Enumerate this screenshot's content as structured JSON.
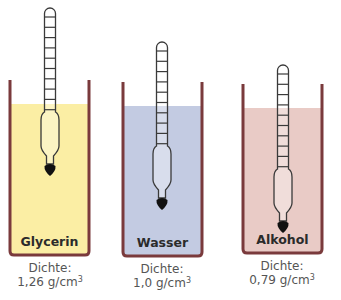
{
  "diagram": {
    "wall_color": "#7a3a3c",
    "hydrometer_stroke": "#3a3a3a",
    "weight_color": "#111111",
    "containers": [
      {
        "id": "glycerin",
        "label": "Glycerin",
        "density_label": "Dichte:",
        "density_value": "1,26 g/cm",
        "density_exp": "3",
        "liquid_color": "#fbeea4",
        "x": 10,
        "width": 79,
        "top": 80,
        "liquid_top": 104,
        "bottom": 255,
        "hydrometer": {
          "cx": 50,
          "top": 8,
          "ticks": 10
        }
      },
      {
        "id": "wasser",
        "label": "Wasser",
        "density_label": "Dichte:",
        "density_value": "1,0 g/cm",
        "density_exp": "3",
        "liquid_color": "#c3cbe2",
        "x": 123,
        "width": 79,
        "top": 82,
        "liquid_top": 106,
        "bottom": 256,
        "hydrometer": {
          "cx": 162,
          "top": 42,
          "ticks": 10
        }
      },
      {
        "id": "alkohol",
        "label": "Alkohol",
        "density_label": "Dichte:",
        "density_value": "0,79 g/cm",
        "density_exp": "3",
        "liquid_color": "#e9cbc6",
        "x": 243,
        "width": 79,
        "top": 84,
        "liquid_top": 108,
        "bottom": 253,
        "hydrometer": {
          "cx": 283,
          "top": 65,
          "ticks": 10
        }
      }
    ]
  }
}
